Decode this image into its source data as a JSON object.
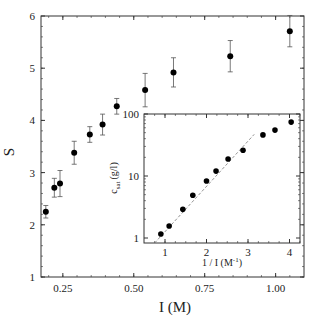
{
  "chart_data": [
    {
      "id": "main",
      "type": "scatter",
      "title": "",
      "xlabel": "I (M)",
      "ylabel": "S",
      "xlim": [
        0.173,
        1.1
      ],
      "ylim": [
        1,
        6
      ],
      "xticks": [
        0.25,
        0.5,
        0.75,
        1.0
      ],
      "xtick_labels": [
        "0.25",
        "0.50",
        "0.75",
        "1.00"
      ],
      "yticks": [
        1,
        2,
        3,
        4,
        5,
        6
      ],
      "ytick_labels": [
        "1",
        "2",
        "3",
        "4",
        "5",
        "6"
      ],
      "grid": false,
      "legend": null,
      "series": [
        {
          "name": "S vs I",
          "marker": "filled-circle",
          "error_bars": true,
          "points": [
            {
              "x": 0.19,
              "y": 2.25,
              "err": 0.12
            },
            {
              "x": 0.22,
              "y": 2.71,
              "err": 0.18
            },
            {
              "x": 0.24,
              "y": 2.79,
              "err": 0.25
            },
            {
              "x": 0.29,
              "y": 3.38,
              "err": 0.22
            },
            {
              "x": 0.345,
              "y": 3.73,
              "err": 0.15
            },
            {
              "x": 0.39,
              "y": 3.92,
              "err": 0.2
            },
            {
              "x": 0.44,
              "y": 4.27,
              "err": 0.15
            },
            {
              "x": 0.54,
              "y": 4.58,
              "err": 0.32
            },
            {
              "x": 0.64,
              "y": 4.92,
              "err": 0.28
            },
            {
              "x": 0.84,
              "y": 5.23,
              "err": 0.3
            },
            {
              "x": 1.05,
              "y": 5.71,
              "err": 0.3
            }
          ]
        }
      ]
    },
    {
      "id": "inset",
      "type": "scatter",
      "title": "",
      "xlabel": "1 / I (M⁻¹)",
      "ylabel": "c_sat (g/l)",
      "xlim": [
        0.55,
        4.3
      ],
      "ylim": [
        0.85,
        110
      ],
      "yscale": "log",
      "xticks": [
        1,
        2,
        3,
        4
      ],
      "xtick_labels": [
        "1",
        "2",
        "3",
        "4"
      ],
      "yticks": [
        1,
        10,
        100
      ],
      "ytick_labels": [
        "1",
        "10",
        "100"
      ],
      "grid": false,
      "legend": null,
      "series": [
        {
          "name": "c_sat vs 1/I",
          "marker": "filled-circle",
          "points": [
            {
              "x": 0.9,
              "y": 1.16
            },
            {
              "x": 1.1,
              "y": 1.56
            },
            {
              "x": 1.43,
              "y": 2.9
            },
            {
              "x": 1.67,
              "y": 4.9
            },
            {
              "x": 2.0,
              "y": 8.3
            },
            {
              "x": 2.23,
              "y": 12
            },
            {
              "x": 2.52,
              "y": 18.8
            },
            {
              "x": 2.88,
              "y": 26
            },
            {
              "x": 3.36,
              "y": 46
            },
            {
              "x": 3.65,
              "y": 55
            },
            {
              "x": 4.04,
              "y": 74
            }
          ]
        },
        {
          "name": "exponential fit",
          "style": "dashed-line",
          "points": [
            {
              "x": 0.75,
              "y": 0.83
            },
            {
              "x": 3.15,
              "y": 47
            }
          ]
        }
      ]
    }
  ],
  "labels": {
    "main_xlabel": "I (M)",
    "main_ylabel": "S",
    "inset_ylabel_c": "c",
    "inset_ylabel_sub": "sat",
    "inset_ylabel_unit": "(g/l)",
    "inset_xlabel_main": "1 / I (M",
    "inset_xlabel_sup": "-1",
    "inset_xlabel_close": ")"
  },
  "colors": {
    "marker": "#000000",
    "axis": "#333333",
    "errorbar": "#555555",
    "fit_line": "#777777"
  }
}
